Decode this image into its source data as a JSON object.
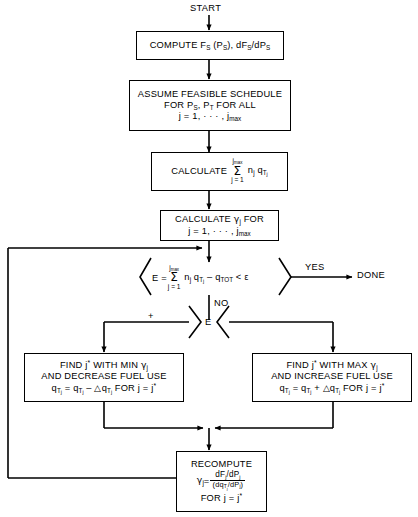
{
  "diagram": {
    "start_label": "START",
    "done_label": "DONE",
    "yes_label": "YES",
    "no_label": "NO",
    "plus_label": "+",
    "error_symbol": "E",
    "stroke_color": "#000000",
    "background_color": "#ffffff",
    "nodes": {
      "compute_fs": {
        "type": "process",
        "line1": "COMPUTE F",
        "line1_sub1": "S",
        "line1_mid": " (P",
        "line1_sub2": "S",
        "line1_mid2": "), dF",
        "line1_sub3": "S",
        "line1_mid3": "/dP",
        "line1_sub4": "S",
        "plain": "COMPUTE F_S (P_S), dF_S/dP_S"
      },
      "assume_schedule": {
        "type": "process",
        "line1": "ASSUME FEASIBLE SCHEDULE",
        "line2_a": "FOR P",
        "line2_sub1": "S",
        "line2_b": ", P",
        "line2_sub2": "T",
        "line2_c": " FOR ALL",
        "line3_a": "j = 1, · · · , j",
        "line3_sub": "max",
        "plain": "ASSUME FEASIBLE SCHEDULE FOR P_S, P_T FOR ALL j = 1, ..., j_max"
      },
      "calculate_sum": {
        "type": "process",
        "label": "CALCULATE",
        "sum_top": "j",
        "sum_top_sub": "max",
        "sum_sigma": "Σ",
        "sum_bot": "j = 1",
        "term_a": "n",
        "term_a_sub": "j",
        "term_b": "q",
        "term_b_sub": "T",
        "term_b_subsub": "j",
        "plain": "CALCULATE sum_{j=1}^{j_max} n_j q_Tj"
      },
      "calculate_gamma": {
        "type": "process",
        "line1_a": "CALCULATE ",
        "line1_gamma": "γ",
        "line1_sub": "j",
        "line1_b": " FOR",
        "line2_a": "j = 1, · · · , j",
        "line2_sub": "max",
        "plain": "CALCULATE gamma_j FOR j = 1, ..., j_max"
      },
      "error_test": {
        "type": "decision",
        "lhs": "E = ",
        "sum_top": "j",
        "sum_top_sub": "max",
        "sum_sigma": "Σ",
        "sum_bot": "j = 1",
        "term_a": "n",
        "term_a_sub": "j",
        "term_b": "q",
        "term_b_sub": "T",
        "term_b_subsub": "j",
        "minus": " – q",
        "qtot_sub": "TOT",
        "compare": " < ",
        "epsilon": "ε",
        "plain": "E = sum_{j=1}^{j_max} n_j q_Tj - q_TOT < epsilon"
      },
      "sign_test": {
        "type": "decision",
        "label": "E",
        "plain": "E sign test"
      },
      "decrease_fuel": {
        "type": "process",
        "line1_a": "FIND j",
        "line1_star": "*",
        "line1_b": " WITH MIN ",
        "line1_gamma": "γ",
        "line1_sub": "j",
        "line2": "AND DECREASE FUEL USE",
        "line3_a": "q",
        "line3_sub_a": "T",
        "line3_subsub_a": "j",
        "line3_eq": " = q",
        "line3_sub_b": "T",
        "line3_subsub_b": "j",
        "line3_op": " – △q",
        "line3_sub_c": "T",
        "line3_subsub_c": "j",
        "line3_tail": " FOR j = j",
        "line3_star": "*",
        "plain": "FIND j* WITH MIN gamma_j AND DECREASE FUEL USE q_Tj = q_Tj - delta q_Tj FOR j = j*"
      },
      "increase_fuel": {
        "type": "process",
        "line1_a": "FIND j",
        "line1_star": "*",
        "line1_b": " WITH MAX ",
        "line1_gamma": "γ",
        "line1_sub": "j",
        "line2": "AND INCREASE FUEL USE",
        "line3_a": "q",
        "line3_sub_a": "T",
        "line3_subsub_a": "j",
        "line3_eq": " = q",
        "line3_sub_b": "T",
        "line3_subsub_b": "j",
        "line3_op": " + △q",
        "line3_sub_c": "T",
        "line3_subsub_c": "j",
        "line3_tail": " FOR j = j",
        "line3_star": "*",
        "plain": "FIND j* WITH MAX gamma_j AND INCREASE FUEL USE q_Tj = q_Tj + delta q_Tj FOR j = j*"
      },
      "recompute": {
        "type": "process",
        "line1": "RECOMPUTE",
        "gamma": "γ",
        "gamma_sub": "j",
        "equals": " = ",
        "numerator_a": "dF",
        "numerator_sub_a": "j",
        "numerator_b": "/dP",
        "numerator_sub_b": "j",
        "denominator_a": "(dq",
        "denominator_sub_a": "T",
        "denominator_subsub_a": "j",
        "denominator_b": "/dP",
        "denominator_sub_b": "j",
        "denominator_c": ")",
        "line3_a": "FOR j = j",
        "line3_star": "*",
        "plain": "RECOMPUTE gamma_j = (dF_j/dP_j)/(dq_Tj/dP_j) FOR j = j*"
      }
    }
  }
}
